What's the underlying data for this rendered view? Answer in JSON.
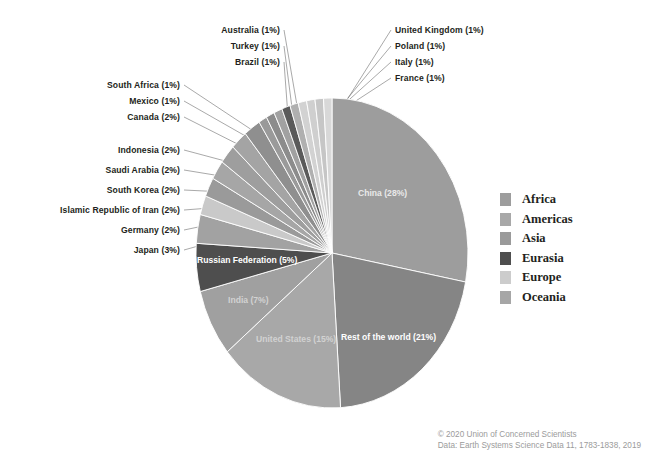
{
  "chart_data": {
    "type": "pie",
    "title": "",
    "subtitle": "",
    "xlabel": "",
    "ylabel": "",
    "grid": false,
    "legend_position": "right",
    "start_angle_deg": 0,
    "direction": "clockwise",
    "categories": [
      "China",
      "Rest of the world",
      "United States",
      "India",
      "Russian Federation",
      "Japan",
      "Germany",
      "Islamic Republic of Iran",
      "South Korea",
      "Saudi Arabia",
      "Indonesia",
      "Canada",
      "Mexico",
      "South Africa",
      "Brazil",
      "Turkey",
      "Australia",
      "France",
      "Italy",
      "Poland",
      "United Kingdom"
    ],
    "values": [
      28,
      21,
      15,
      7,
      5,
      3,
      2,
      2,
      2,
      2,
      2,
      2,
      1,
      1,
      1,
      1,
      1,
      1,
      1,
      1,
      1
    ],
    "value_unit": "%",
    "slice_colors": [
      "#9d9d9d",
      "#858585",
      "#a8a8a8",
      "#a0a0a0",
      "#4e4e4e",
      "#a2a2a2",
      "#c9c9c9",
      "#9a9a9a",
      "#a6a6a6",
      "#9e9e9e",
      "#a4a4a4",
      "#8f8f8f",
      "#9a9a9a",
      "#8c8c8c",
      "#a1a1a1",
      "#5a5a5a",
      "#b0b0b0",
      "#d2d2d2",
      "#cfcfcf",
      "#c6c6c6",
      "#d8d8d8"
    ],
    "labels": [
      "China (28%)",
      "Rest of the world (21%)",
      "United States (15%)",
      "India (7%)",
      "Russian Federation (5%)",
      "Japan (3%)",
      "Germany (2%)",
      "Islamic Republic of Iran (2%)",
      "South Korea (2%)",
      "Saudi Arabia (2%)",
      "Indonesia (2%)",
      "Canada (2%)",
      "Mexico (1%)",
      "South Africa (1%)",
      "Brazil (1%)",
      "Turkey (1%)",
      "Australia (1%)",
      "France (1%)",
      "Italy (1%)",
      "Poland (1%)",
      "United Kingdom (1%)"
    ]
  },
  "inner_labels": [
    {
      "text": "China (28%)",
      "x": 358,
      "y": 188,
      "tone": "faint"
    },
    {
      "text": "Rest of the world (21%)",
      "x": 341,
      "y": 332,
      "tone": "light"
    },
    {
      "text": "United States (15%)",
      "x": 256,
      "y": 334,
      "tone": "dim"
    },
    {
      "text": "India (7%)",
      "x": 228,
      "y": 295,
      "tone": "dim"
    },
    {
      "text": "Russian Federation (5%)",
      "x": 197,
      "y": 255,
      "tone": "light"
    }
  ],
  "callouts_left": [
    {
      "text": "South Africa (1%)",
      "x": 80,
      "y": 80
    },
    {
      "text": "Mexico (1%)",
      "x": 80,
      "y": 96
    },
    {
      "text": "Canada (2%)",
      "x": 80,
      "y": 112
    },
    {
      "text": "Indonesia (2%)",
      "x": 80,
      "y": 145
    },
    {
      "text": "Saudi Arabia (2%)",
      "x": 80,
      "y": 165
    },
    {
      "text": "South Korea (2%)",
      "x": 80,
      "y": 185
    },
    {
      "text": "Islamic Republic of Iran (2%)",
      "x": 80,
      "y": 205
    },
    {
      "text": "Germany (2%)",
      "x": 80,
      "y": 225
    },
    {
      "text": "Japan (3%)",
      "x": 80,
      "y": 245
    }
  ],
  "callouts_top": [
    {
      "text": "Australia (1%)",
      "x": 210,
      "y": 25
    },
    {
      "text": "Turkey (1%)",
      "x": 210,
      "y": 41
    },
    {
      "text": "Brazil (1%)",
      "x": 210,
      "y": 57
    }
  ],
  "callouts_right": [
    {
      "text": "United Kingdom (1%)",
      "x": 395,
      "y": 25
    },
    {
      "text": "Poland (1%)",
      "x": 395,
      "y": 41
    },
    {
      "text": "Italy (1%)",
      "x": 395,
      "y": 57
    },
    {
      "text": "France (1%)",
      "x": 395,
      "y": 73
    }
  ],
  "legend": {
    "items": [
      {
        "label": "Africa",
        "color": "#9d9d9d"
      },
      {
        "label": "Americas",
        "color": "#a8a8a8"
      },
      {
        "label": "Asia",
        "color": "#9a9a9a"
      },
      {
        "label": "Eurasia",
        "color": "#4e4e4e"
      },
      {
        "label": "Europe",
        "color": "#cccccc"
      },
      {
        "label": "Oceania",
        "color": "#a6a6a6"
      }
    ]
  },
  "footer": {
    "line1": "© 2020 Union of Concerned Scientists",
    "line2": "Data: Earth Systems Science Data 11, 1783-1838, 2019"
  },
  "geometry": {
    "cx": 332,
    "cy": 253,
    "rx": 136,
    "ry": 155
  }
}
